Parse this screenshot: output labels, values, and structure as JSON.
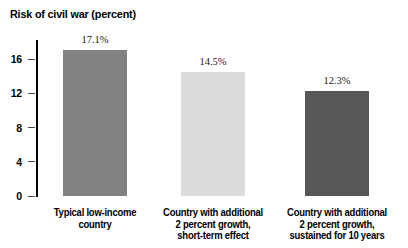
{
  "chart_data": {
    "type": "bar",
    "title": "Risk of civil war (percent)",
    "xlabel": "",
    "ylabel": "",
    "ylim": [
      0,
      18
    ],
    "grid": false,
    "legend": "none",
    "y_ticks": [
      "0",
      "4",
      "8",
      "12",
      "16"
    ],
    "y_tick_values": [
      0,
      4,
      8,
      12,
      16
    ],
    "categories": [
      "Typical low-income country",
      "Country with additional 2 percent growth, short-term effect",
      "Country with additional 2 percent growth, sustained for 10 years"
    ],
    "category_lines": [
      [
        "Typical low-income",
        "country"
      ],
      [
        "Country with additional",
        "2 percent growth,",
        "short-term effect"
      ],
      [
        "Country with additional",
        "2 percent growth,",
        "sustained for 10 years"
      ]
    ],
    "values": [
      17.1,
      14.5,
      12.3
    ],
    "value_labels": [
      "17.1%",
      "14.5%",
      "12.3%"
    ],
    "bar_colors": [
      "#828282",
      "#dcdcdc",
      "#575757"
    ]
  },
  "axis": {
    "line_color": "#000000",
    "tick_color": "#4a4a4a"
  }
}
